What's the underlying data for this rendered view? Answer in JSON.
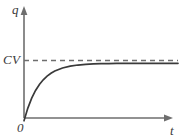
{
  "figure": {
    "background_color": "#ffffff",
    "axis_color": "#6e6e6e",
    "curve_color": "#3a3a3a",
    "asymptote_color": "#6e6e6e",
    "label_color": "#3a3a3a"
  },
  "labels": {
    "y_axis": "q",
    "x_axis": "t",
    "origin": "0",
    "asymptote": "CV"
  },
  "chart_data": {
    "type": "line",
    "title": "",
    "xlabel": "t",
    "ylabel": "q",
    "grid": false,
    "legend": null,
    "annotations": [
      {
        "text": "CV",
        "type": "y-axis-tick",
        "y": 1.0
      },
      {
        "text": "0",
        "type": "origin",
        "x": 0,
        "y": 0
      }
    ],
    "xlim": [
      0,
      10
    ],
    "ylim": [
      0,
      1.15
    ],
    "series": [
      {
        "name": "q(t) = CV(1 - e^(-t/RC))",
        "style": "solid",
        "x": [
          0.0,
          0.25,
          0.5,
          0.75,
          1.0,
          1.25,
          1.5,
          1.75,
          2.0,
          2.5,
          3.0,
          3.5,
          4.0,
          4.5,
          5.0,
          5.5,
          6.0,
          6.5,
          7.0,
          7.5,
          8.0,
          8.5,
          9.0,
          9.5,
          10.0
        ],
        "y": [
          0.0,
          0.221,
          0.393,
          0.528,
          0.632,
          0.713,
          0.777,
          0.826,
          0.865,
          0.918,
          0.95,
          0.97,
          0.982,
          0.989,
          0.993,
          0.996,
          0.998,
          0.998,
          0.999,
          0.999,
          1.0,
          1.0,
          1.0,
          1.0,
          1.0
        ]
      },
      {
        "name": "CV asymptote",
        "style": "dashed",
        "x": [
          0,
          10
        ],
        "y": [
          1.0,
          1.0
        ]
      }
    ]
  }
}
